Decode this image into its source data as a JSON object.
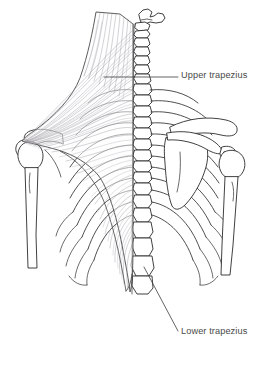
{
  "figure": {
    "background_color": "#ffffff",
    "width": 271,
    "height": 365,
    "line_color": "#2b2b2b",
    "fiber_color": "#8d8a92",
    "label_color": "#4a4a4a"
  },
  "labels": {
    "upper": {
      "text": "Upper trapezius",
      "x": 181,
      "y": 71,
      "leader": {
        "type": "horizontal",
        "from_x": 104,
        "from_y": 77,
        "to_x": 178,
        "to_y": 77
      }
    },
    "lower": {
      "text": "Lower trapezius",
      "x": 181,
      "y": 327,
      "leader": {
        "type": "diagonal",
        "from_x": 144,
        "from_y": 267,
        "to_x": 178,
        "to_y": 331
      }
    }
  },
  "anatomy": {
    "structures": [
      "skull-base",
      "cervical-spine",
      "thoracic-spine",
      "rib-cage-left",
      "rib-cage-right",
      "scapula-left",
      "scapula-right",
      "clavicle-left",
      "clavicle-right",
      "humerus-left",
      "humerus-right",
      "trapezius-muscle"
    ],
    "vertebrae_count": 17,
    "ribs_per_side": 12,
    "view": "posterior"
  }
}
